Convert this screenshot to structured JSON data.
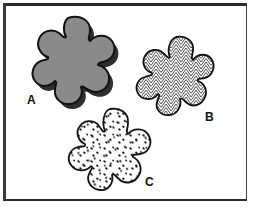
{
  "figure": {
    "background_color": "#ffffff",
    "border_color": "#2b2b2b",
    "width": 253,
    "height": 208
  },
  "shapes": [
    {
      "id": "A",
      "label": "A",
      "fill_style": "solid-gray",
      "fill_color": "#8a8a8a",
      "outline_color": "#111111",
      "has_drop_shadow": true,
      "shadow_color": "#2e2e2e",
      "lobes": 6,
      "description": "solid gray amoeba blob with drop shadow"
    },
    {
      "id": "B",
      "label": "B",
      "fill_style": "herringbone-hatch",
      "fill_color": "#ffffff",
      "pattern_color": "#3a3a3a",
      "outline_color": "#111111",
      "has_drop_shadow": false,
      "lobes": 6,
      "description": "blob filled with fine herringbone chevron hatching"
    },
    {
      "id": "C",
      "label": "C",
      "fill_style": "stipple-speckles",
      "fill_color": "#ffffff",
      "pattern_color": "#1a1a1a",
      "outline_color": "#111111",
      "has_drop_shadow": false,
      "lobes": 6,
      "description": "blob filled with scattered comma-shaped speckles"
    }
  ]
}
